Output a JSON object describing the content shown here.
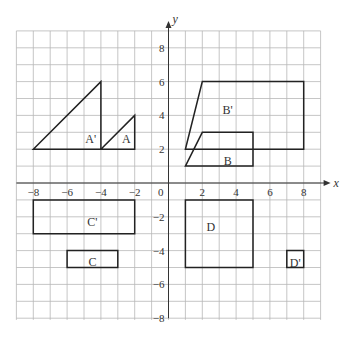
{
  "diagram": {
    "axes": {
      "x_label": "x",
      "y_label": "y",
      "x_range": [
        -9,
        9
      ],
      "y_range": [
        -8,
        9
      ],
      "origin_label": "0",
      "x_ticks": [
        {
          "value": -8,
          "label": "−8"
        },
        {
          "value": -6,
          "label": "−6"
        },
        {
          "value": -4,
          "label": "−4"
        },
        {
          "value": -2,
          "label": "−2"
        },
        {
          "value": 2,
          "label": "2"
        },
        {
          "value": 4,
          "label": "4"
        },
        {
          "value": 6,
          "label": "6"
        },
        {
          "value": 8,
          "label": "8"
        }
      ],
      "y_ticks": [
        {
          "value": 8,
          "label": "8"
        },
        {
          "value": 6,
          "label": "6"
        },
        {
          "value": 4,
          "label": "4"
        },
        {
          "value": 2,
          "label": "2"
        },
        {
          "value": -2,
          "label": "−2"
        },
        {
          "value": -4,
          "label": "−4"
        },
        {
          "value": -6,
          "label": "−6"
        },
        {
          "value": -8,
          "label": "−8"
        }
      ]
    },
    "shapes": [
      {
        "name": "A",
        "label": "A",
        "points": [
          [
            -4,
            2
          ],
          [
            -2,
            4
          ],
          [
            -2,
            2
          ]
        ],
        "label_pos": [
          -2.5,
          2.6
        ]
      },
      {
        "name": "A'",
        "label": "A'",
        "points": [
          [
            -8,
            2
          ],
          [
            -4,
            6
          ],
          [
            -4,
            2
          ]
        ],
        "label_pos": [
          -4.6,
          2.6
        ]
      },
      {
        "name": "B",
        "label": "B",
        "points": [
          [
            1,
            1
          ],
          [
            2,
            3
          ],
          [
            5,
            3
          ],
          [
            5,
            1
          ]
        ],
        "label_pos": [
          3.5,
          1.3
        ]
      },
      {
        "name": "B'",
        "label": "B'",
        "points": [
          [
            1,
            2
          ],
          [
            2,
            6
          ],
          [
            8,
            6
          ],
          [
            8,
            2
          ]
        ],
        "label_pos": [
          3.5,
          4.3
        ]
      },
      {
        "name": "C",
        "label": "C",
        "points": [
          [
            -6,
            -4
          ],
          [
            -3,
            -4
          ],
          [
            -3,
            -5
          ],
          [
            -6,
            -5
          ]
        ],
        "label_pos": [
          -4.5,
          -4.7
        ]
      },
      {
        "name": "C'",
        "label": "C'",
        "points": [
          [
            -8,
            -1
          ],
          [
            -2,
            -1
          ],
          [
            -2,
            -3
          ],
          [
            -8,
            -3
          ]
        ],
        "label_pos": [
          -4.5,
          -2.3
        ]
      },
      {
        "name": "D",
        "label": "D",
        "points": [
          [
            1,
            -1
          ],
          [
            5,
            -1
          ],
          [
            5,
            -5
          ],
          [
            1,
            -5
          ]
        ],
        "label_pos": [
          2.5,
          -2.6
        ]
      },
      {
        "name": "D'",
        "label": "D'",
        "points": [
          [
            7,
            -4
          ],
          [
            8,
            -4
          ],
          [
            8,
            -5
          ],
          [
            7,
            -5
          ]
        ],
        "label_pos": [
          7.5,
          -4.75
        ]
      }
    ]
  }
}
